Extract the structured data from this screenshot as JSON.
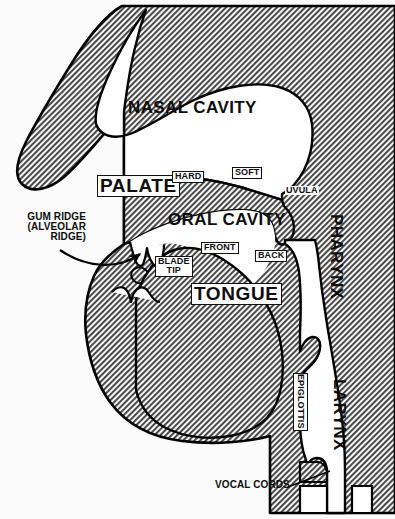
{
  "diagram": {
    "background_color": "#fbfbfb",
    "tissue_fill_color": "#9a9a9a",
    "cavity_color": "#ffffff",
    "outline_color": "#000000",
    "width": 395,
    "height": 519
  },
  "labels": {
    "nasal_cavity": "NASAL CAVITY",
    "oral_cavity": "ORAL CAVITY",
    "palate": "PALATE",
    "hard": "HARD",
    "soft": "SOFT",
    "uvula": "UVULA",
    "gum_ridge": "GUM RIDGE\n(ALVEOLAR\nRIDGE)",
    "tongue": "TONGUE",
    "front": "FRONT",
    "back": "BACK",
    "blade_tip": "BLADE\nTIP",
    "pharynx": "PHARYNX",
    "larynx": "LARYNX",
    "epiglottis": "EPIGLOTTIS",
    "vocal_cords": "VOCAL CORDS"
  },
  "annotations": {
    "gum_ridge_pointer": "curved-arrow-to-alveolar-ridge",
    "vocal_cords_pointer": "leader-line-to-vocal-folds"
  }
}
